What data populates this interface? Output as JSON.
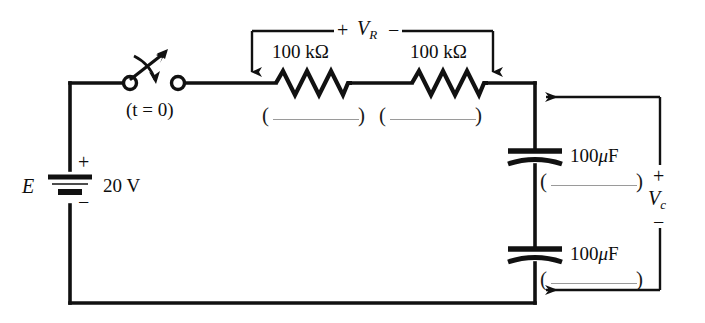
{
  "diagram": {
    "type": "schematic",
    "background_color": "#ffffff",
    "wire_color": "#111111"
  },
  "source": {
    "designator": "E",
    "value": "20 V",
    "plus_sign": "+",
    "minus_sign": "−"
  },
  "switch": {
    "label": "(t = 0)",
    "label_t": "t",
    "label_eq": " = 0",
    "state": "open"
  },
  "resistors": [
    {
      "value": "100 kΩ",
      "blank": "(__________)"
    },
    {
      "value": "100 kΩ",
      "blank": "(__________)"
    }
  ],
  "capacitors": [
    {
      "value": "100 μF",
      "value_num": "100",
      "value_unit": "F",
      "blank": "(__________)"
    },
    {
      "value": "100 μF",
      "value_num": "100",
      "value_unit": "F",
      "blank": "(__________)"
    }
  ],
  "measurements": [
    {
      "name": "V_R",
      "symbol": "V",
      "subscript": "R",
      "plus_sign": "+",
      "minus_sign": "−",
      "orientation": "horizontal-top"
    },
    {
      "name": "V_C",
      "symbol": "V",
      "subscript": "c",
      "plus_sign": "+",
      "minus_sign": "−",
      "orientation": "vertical-right"
    }
  ]
}
